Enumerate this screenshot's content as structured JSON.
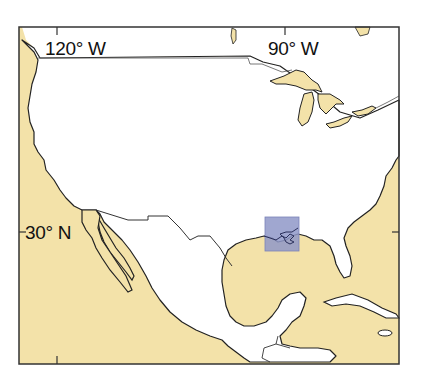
{
  "map": {
    "region": "United States, Mexico, Gulf of Mexico, Caribbean",
    "colors": {
      "ocean": "#f3e2a9",
      "land": "#ffffff",
      "lakes": "#f3e2a9",
      "border": "#222222",
      "highlight": "#8f98c8"
    },
    "graticule_labels": {
      "lon_120w": "120° W",
      "lon_90w": "90° W",
      "lat_30n": "30° N"
    },
    "highlight_box": {
      "description": "Study area on northern Gulf coast (Louisiana / Mississippi delta)",
      "x": 265,
      "y": 217,
      "width": 34,
      "height": 34
    }
  }
}
